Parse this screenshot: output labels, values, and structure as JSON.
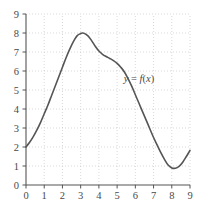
{
  "chart_data": {
    "type": "line",
    "title": "",
    "subtitle": "",
    "xlabel": "",
    "ylabel": "",
    "xlim": [
      0,
      9
    ],
    "ylim": [
      0,
      9
    ],
    "xticks": [
      0,
      1,
      2,
      3,
      4,
      5,
      6,
      7,
      8,
      9
    ],
    "yticks": [
      0,
      1,
      2,
      3,
      4,
      5,
      6,
      7,
      8,
      9
    ],
    "xtick_labels": [
      "0",
      "1",
      "2",
      "3",
      "4",
      "5",
      "6",
      "7",
      "8",
      "9"
    ],
    "ytick_labels": [
      "0",
      "1",
      "2",
      "3",
      "4",
      "5",
      "6",
      "7",
      "8",
      "9"
    ],
    "grid": true,
    "grid_style": "dotted",
    "legend": null,
    "legend_position": "none",
    "annotations": [
      {
        "name": "curve-equation-label",
        "text": "y = f(x)",
        "text_parts": {
          "lhs": "y",
          "operator": "=",
          "rhs_func": "f",
          "rhs_open": "(",
          "rhs_var": "x",
          "rhs_close": ")"
        },
        "x": 6.2,
        "y": 5.4
      }
    ],
    "series": [
      {
        "name": "f",
        "label": "y = f(x)",
        "color": "#555555",
        "linewidth": 1.6,
        "x": [
          0.0,
          0.2,
          0.4,
          0.6,
          0.8,
          1.0,
          1.2,
          1.4,
          1.6,
          1.8,
          2.0,
          2.2,
          2.4,
          2.6,
          2.8,
          3.0,
          3.1,
          3.2,
          3.4,
          3.6,
          3.8,
          4.0,
          4.2,
          4.4,
          4.6,
          4.8,
          5.0,
          5.2,
          5.4,
          5.6,
          5.8,
          6.0,
          6.2,
          6.4,
          6.6,
          6.8,
          7.0,
          7.2,
          7.4,
          7.6,
          7.8,
          8.0,
          8.2,
          8.4,
          8.6,
          8.8,
          9.0
        ],
        "y": [
          2.0,
          2.25,
          2.55,
          2.9,
          3.3,
          3.75,
          4.2,
          4.7,
          5.2,
          5.7,
          6.2,
          6.7,
          7.15,
          7.55,
          7.85,
          7.97,
          8.0,
          7.98,
          7.85,
          7.6,
          7.3,
          7.05,
          6.88,
          6.76,
          6.66,
          6.55,
          6.4,
          6.2,
          5.95,
          5.6,
          5.2,
          4.75,
          4.3,
          3.85,
          3.4,
          2.95,
          2.5,
          2.1,
          1.7,
          1.35,
          1.05,
          0.9,
          0.88,
          0.98,
          1.2,
          1.5,
          1.82
        ]
      }
    ],
    "key_points": {
      "start": {
        "x": 0,
        "y": 2.0
      },
      "maximum": {
        "x": 3.1,
        "y": 8.0
      },
      "shoulder": {
        "x": 4.0,
        "y": 7.05
      },
      "minimum": {
        "x": 8.1,
        "y": 0.88
      },
      "end": {
        "x": 9,
        "y": 1.82
      }
    }
  },
  "colors": {
    "curve": "#555555",
    "axis": "#555555",
    "grid": "#c8c8c8",
    "tick_label": "#4a4a4a",
    "background": "#ffffff"
  }
}
